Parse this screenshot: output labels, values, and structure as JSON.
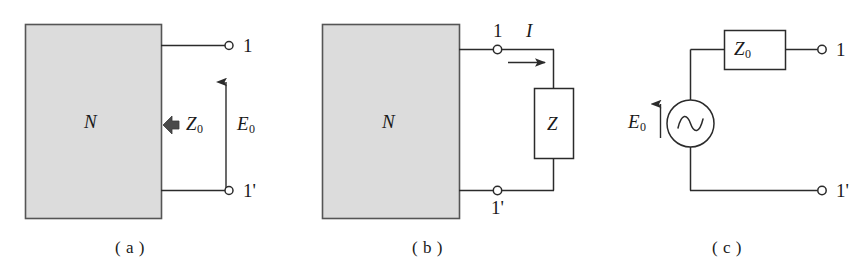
{
  "figure": {
    "background_color": "#ffffff",
    "line_color": "#2b2b2b",
    "network_fill_color": "#dcdcdc",
    "network_stroke_color": "#555555",
    "arrow_fill_color": "#4a4a4a"
  },
  "panels": [
    {
      "id": "panel-a",
      "caption": "( a )",
      "network_label": "N",
      "impedance_label": "Z",
      "impedance_sub": "0",
      "emf_label": "E",
      "emf_sub": "0",
      "terminal_top_label": "1",
      "terminal_bottom_label": "1'"
    },
    {
      "id": "panel-b",
      "caption": "( b )",
      "network_label": "N",
      "load_label": "Z",
      "current_label": "I",
      "terminal_top_label": "1",
      "terminal_bottom_label": "1'"
    },
    {
      "id": "panel-c",
      "caption": "( c )",
      "impedance_label": "Z",
      "impedance_sub": "0",
      "source_label": "E",
      "source_sub": "0",
      "source_symbol": "ac-sine-source",
      "terminal_top_label": "1",
      "terminal_bottom_label": "1'"
    }
  ]
}
